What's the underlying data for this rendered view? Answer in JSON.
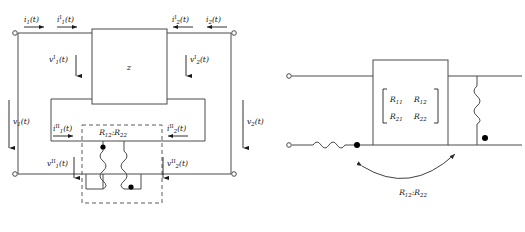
{
  "figure": {
    "left_diagram": {
      "box_label": "z",
      "top_left_currents": [
        {
          "name": "i1-total",
          "text": "i₁(t)",
          "base": "i",
          "sub": "1",
          "sup": "",
          "arg": "(t)",
          "direction": "right"
        },
        {
          "name": "i1-part-I",
          "text": "i₁ᴵ(t)",
          "base": "i",
          "sub": "1",
          "sup": "I",
          "arg": "(t)",
          "direction": "right"
        }
      ],
      "top_right_currents": [
        {
          "name": "i2-part-I",
          "text": "i₂ᴵ(t)",
          "base": "i",
          "sub": "2",
          "sup": "I",
          "arg": "(t)",
          "direction": "left"
        },
        {
          "name": "i2-total",
          "text": "i₂(t)",
          "base": "i",
          "sub": "2",
          "sup": "",
          "arg": "(t)",
          "direction": "left"
        }
      ],
      "inner_voltages": [
        {
          "name": "v1-part-I",
          "base": "v",
          "sub": "1",
          "sup": "I",
          "arg": "(t)",
          "direction": "down"
        },
        {
          "name": "v2-part-I",
          "base": "v",
          "sub": "2",
          "sup": "I",
          "arg": "(t)",
          "direction": "down"
        }
      ],
      "outer_voltages": [
        {
          "name": "v1-total",
          "base": "v",
          "sub": "1",
          "sup": "",
          "arg": "(t)",
          "direction": "down"
        },
        {
          "name": "v2-total",
          "base": "v",
          "sub": "2",
          "sup": "",
          "arg": "(t)",
          "direction": "down"
        }
      ],
      "transformer": {
        "ratio_base": "R",
        "ratio_sub_left": "12",
        "ratio_sub_right": "22",
        "ratio_separator": ":",
        "dot_left_position": "top",
        "dot_right_position": "bottom",
        "enclosure": "dashed"
      },
      "lower_currents": [
        {
          "name": "i1-part-II",
          "base": "i",
          "sub": "1",
          "sup": "II",
          "arg": "(t)",
          "direction": "right"
        },
        {
          "name": "i2-part-II",
          "base": "i",
          "sub": "2",
          "sup": "II",
          "arg": "(t)",
          "direction": "left"
        }
      ],
      "lower_voltages": [
        {
          "name": "v1-part-II",
          "base": "v",
          "sub": "1",
          "sup": "II",
          "arg": "(t)",
          "direction": "down"
        },
        {
          "name": "v2-part-II",
          "base": "v",
          "sub": "2",
          "sup": "II",
          "arg": "(t)",
          "direction": "down"
        }
      ]
    },
    "right_diagram": {
      "matrix": {
        "rows": [
          [
            {
              "base": "R",
              "sub": "11"
            },
            {
              "base": "R",
              "sub": "12"
            }
          ],
          [
            {
              "base": "R",
              "sub": "21"
            },
            {
              "base": "R",
              "sub": "22"
            }
          ]
        ]
      },
      "annotation": {
        "name": "ratio-annotation",
        "base": "R",
        "sub_left": "12",
        "sub_right": "22",
        "separator": ":"
      },
      "elements": [
        {
          "name": "left-series-resistor",
          "orientation": "horizontal",
          "dot": "right"
        },
        {
          "name": "right-shunt-resistor",
          "orientation": "vertical",
          "dot": "bottom"
        }
      ]
    }
  }
}
